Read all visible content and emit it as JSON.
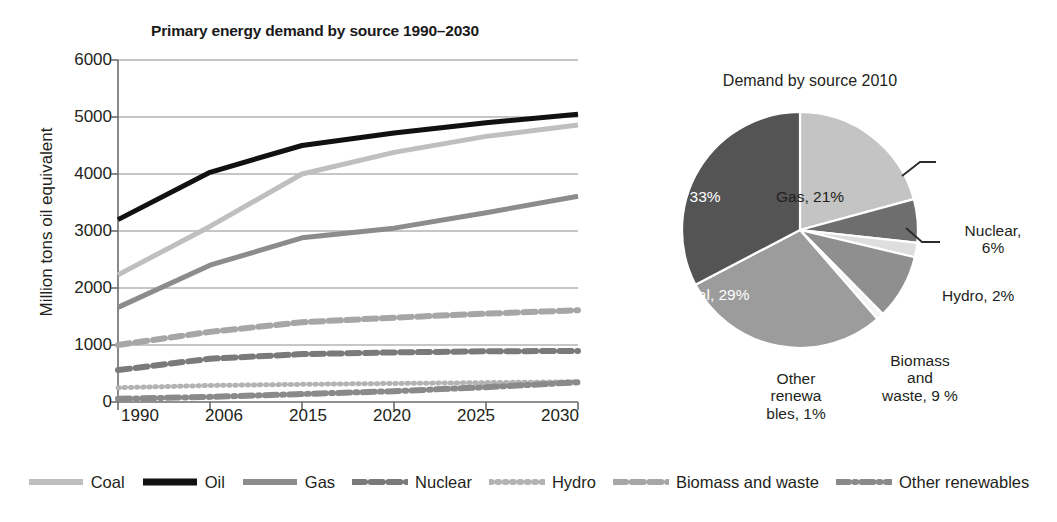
{
  "chart_data": [
    {
      "type": "line",
      "title": "Primary energy demand by source 1990–2030",
      "xlabel": "",
      "ylabel": "Million tons oil equivalent",
      "categories": [
        "1990",
        "2006",
        "2015",
        "2020",
        "2025",
        "2030"
      ],
      "ylim": [
        0,
        6000
      ],
      "yticks": [
        "0",
        "1000",
        "2000",
        "3000",
        "4000",
        "5000",
        "6000"
      ],
      "grid": true,
      "legend_position": "bottom",
      "series": [
        {
          "name": "Coal",
          "values": [
            2230,
            3080,
            4000,
            4380,
            4660,
            4860
          ],
          "color": "#bfbfbf",
          "style": "solid",
          "width": 5
        },
        {
          "name": "Oil",
          "values": [
            3200,
            4030,
            4500,
            4720,
            4900,
            5050
          ],
          "color": "#111111",
          "style": "solid",
          "width": 5
        },
        {
          "name": "Gas",
          "values": [
            1660,
            2400,
            2880,
            3050,
            3320,
            3610
          ],
          "color": "#8c8c8c",
          "style": "solid",
          "width": 5
        },
        {
          "name": "Nuclear",
          "values": [
            560,
            760,
            840,
            870,
            890,
            895
          ],
          "color": "#7a7a7a",
          "style": "dashed",
          "width": 6
        },
        {
          "name": "Hydro",
          "values": [
            250,
            290,
            310,
            325,
            340,
            355
          ],
          "color": "#b3b3b3",
          "style": "dotted",
          "width": 5
        },
        {
          "name": "Biomass and waste",
          "values": [
            1000,
            1230,
            1400,
            1480,
            1550,
            1610
          ],
          "color": "#a6a6a6",
          "style": "dashed",
          "width": 6
        },
        {
          "name": "Other renewables",
          "values": [
            55,
            90,
            140,
            190,
            260,
            345
          ],
          "color": "#8a8a8a",
          "style": "dashdot",
          "width": 6
        }
      ]
    },
    {
      "type": "pie",
      "title": "Demand by source 2010",
      "labels": [
        "Gas",
        "Nuclear",
        "Hydro",
        "Biomass and waste",
        "Other renewables",
        "Coal",
        "Oil"
      ],
      "values": [
        21,
        6,
        2,
        9,
        1,
        29,
        33
      ],
      "colors": [
        "#c4c4c4",
        "#6e6e6e",
        "#dedede",
        "#8f8f8f",
        "#f4f4f4",
        "#9c9c9c",
        "#545454"
      ],
      "label_texts": {
        "gas": "Gas, 21%",
        "oil": "Oil, 33%",
        "coal": "Coal, 29%",
        "nuclear": "Nuclear,\n6%",
        "hydro": "Hydro, 2%",
        "biomass": "Biomass\nand\nwaste, 9 %",
        "other_renewables": "Other\nrenewa\nbles, 1%"
      }
    }
  ],
  "line_chart": {
    "title": "Primary energy demand by source 1990–2030",
    "y_axis_title": "Million tons oil equivalent",
    "y_ticks": [
      "6000",
      "5000",
      "4000",
      "3000",
      "2000",
      "1000",
      "0"
    ],
    "x_ticks": [
      "1990",
      "2006",
      "2015",
      "2020",
      "2025",
      "2030"
    ]
  },
  "pie_chart": {
    "title": "Demand by source 2010",
    "labels": {
      "oil": "Oil, 33%",
      "gas": "Gas, 21%",
      "coal": "Coal, 29%",
      "nuclear": "Nuclear,\n6%",
      "hydro": "Hydro, 2%",
      "biomass": "Biomass\nand\nwaste, 9 %",
      "other_renewables": "Other\nrenewa\nbles, 1%"
    }
  },
  "legend": {
    "items": [
      {
        "label": "Coal",
        "color": "#bfbfbf",
        "style": "solid"
      },
      {
        "label": "Oil",
        "color": "#111111",
        "style": "solid"
      },
      {
        "label": "Gas",
        "color": "#8c8c8c",
        "style": "solid"
      },
      {
        "label": "Nuclear",
        "color": "#7a7a7a",
        "style": "dashed"
      },
      {
        "label": "Hydro",
        "color": "#b3b3b3",
        "style": "dotted"
      },
      {
        "label": "Biomass and waste",
        "color": "#a6a6a6",
        "style": "dashed"
      },
      {
        "label": "Other renewables",
        "color": "#8a8a8a",
        "style": "dashdot"
      }
    ]
  }
}
